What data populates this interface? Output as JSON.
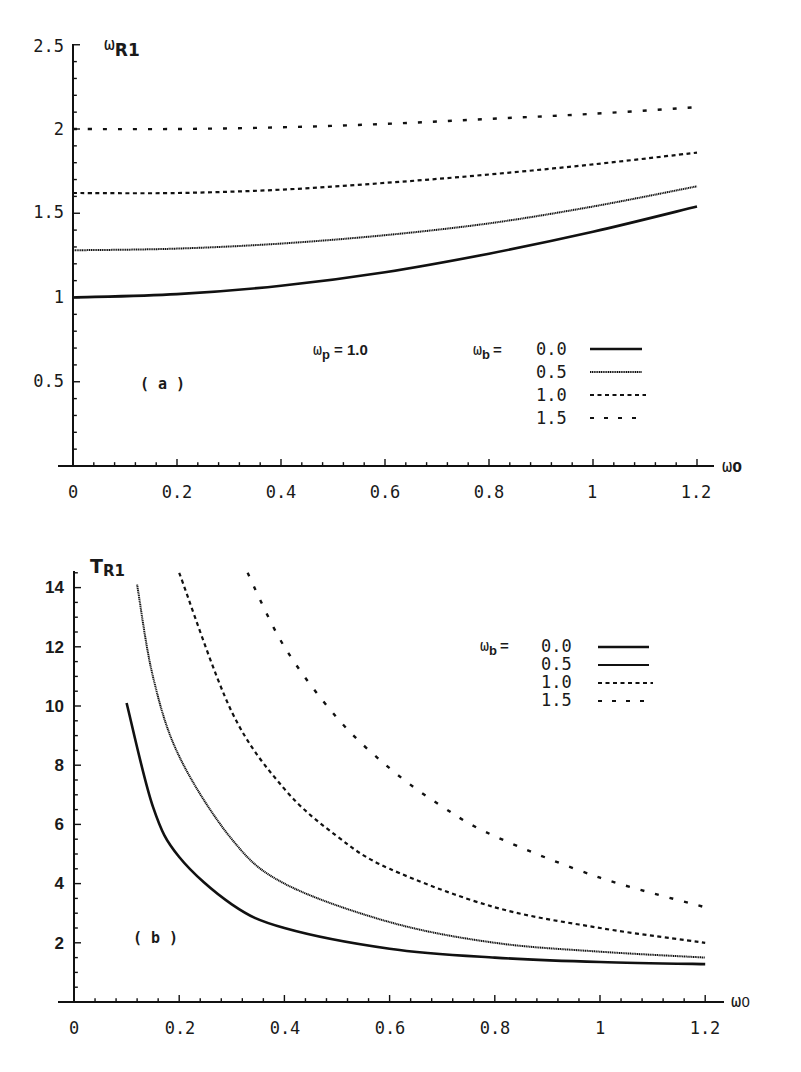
{
  "chart_data": [
    {
      "panel": "(a)",
      "type": "line",
      "title": "",
      "xlabel": "ω0",
      "ylabel": "ωR1",
      "xlim": [
        0,
        1.2
      ],
      "ylim": [
        0,
        2.5
      ],
      "x_ticks": [
        "0",
        "0.2",
        "0.4",
        "0.6",
        "0.8",
        "1",
        "1.2"
      ],
      "y_ticks": [
        "0.5",
        "1",
        "1.5",
        "2",
        "2.5"
      ],
      "grid": false,
      "annotation": "ωp = 1.0",
      "legend_title": "ωb =",
      "legend_position": "inside-right-middle",
      "x": [
        0,
        0.2,
        0.4,
        0.6,
        0.8,
        1.0,
        1.2
      ],
      "series": [
        {
          "name": "0.0",
          "style": "solid-thick",
          "values": [
            1.0,
            1.02,
            1.07,
            1.15,
            1.26,
            1.39,
            1.54
          ]
        },
        {
          "name": "0.5",
          "style": "solid-thin",
          "values": [
            1.28,
            1.29,
            1.32,
            1.37,
            1.44,
            1.54,
            1.66
          ]
        },
        {
          "name": "1.0",
          "style": "fine-dash",
          "values": [
            1.62,
            1.62,
            1.64,
            1.68,
            1.73,
            1.79,
            1.86
          ]
        },
        {
          "name": "1.5",
          "style": "coarse-dash",
          "values": [
            2.0,
            2.0,
            2.01,
            2.03,
            2.06,
            2.09,
            2.13
          ]
        }
      ]
    },
    {
      "panel": "(b)",
      "type": "line",
      "title": "",
      "xlabel": "ω0",
      "ylabel": "TR1",
      "xlim": [
        0,
        1.2
      ],
      "ylim": [
        0,
        14.5
      ],
      "x_ticks": [
        "0",
        "0.2",
        "0.4",
        "0.6",
        "0.8",
        "1",
        "1.2"
      ],
      "y_ticks": [
        "2",
        "4",
        "6",
        "8",
        "10",
        "12",
        "14"
      ],
      "grid": false,
      "legend_title": "ωb =",
      "legend_position": "inside-upper-right",
      "series": [
        {
          "name": "0.0",
          "style": "solid-thick",
          "x": [
            0.1,
            0.15,
            0.2,
            0.3,
            0.4,
            0.6,
            0.8,
            1.0,
            1.2
          ],
          "values": [
            10.1,
            6.6,
            4.9,
            3.3,
            2.5,
            1.8,
            1.5,
            1.35,
            1.28
          ]
        },
        {
          "name": "0.5",
          "style": "solid-thin",
          "x": [
            0.12,
            0.15,
            0.2,
            0.3,
            0.4,
            0.6,
            0.8,
            1.0,
            1.2
          ],
          "values": [
            14.1,
            11.0,
            8.3,
            5.5,
            4.0,
            2.7,
            2.0,
            1.7,
            1.5
          ]
        },
        {
          "name": "1.0",
          "style": "fine-dash",
          "x": [
            0.2,
            0.3,
            0.4,
            0.5,
            0.6,
            0.8,
            1.0,
            1.2
          ],
          "values": [
            14.5,
            9.8,
            7.2,
            5.6,
            4.5,
            3.2,
            2.5,
            2.0
          ]
        },
        {
          "name": "1.5",
          "style": "coarse-dash",
          "x": [
            0.33,
            0.4,
            0.5,
            0.6,
            0.7,
            0.8,
            1.0,
            1.2
          ],
          "values": [
            14.5,
            12.0,
            9.6,
            7.9,
            6.6,
            5.6,
            4.2,
            3.2
          ]
        }
      ]
    }
  ],
  "panel_a": {
    "y_label_main": "ω",
    "y_label_sub": "R1",
    "x_label_main": "ω",
    "x_label_sub": "0",
    "panel_tag": "( a )",
    "param_main": "ω",
    "param_sub": "p",
    "param_value": "= 1.0",
    "legend_main": "ω",
    "legend_sub": "b",
    "legend_eq": "=",
    "legend_items": [
      "0.0",
      "0.5",
      "1.0",
      "1.5"
    ],
    "x_tick_labels": [
      "0",
      "0.2",
      "0.4",
      "0.6",
      "0.8",
      "1",
      "1.2"
    ],
    "y_tick_labels": [
      "0.5",
      "1",
      "1.5",
      "2",
      "2.5"
    ]
  },
  "panel_b": {
    "y_label_main": "T",
    "y_label_sub": "R1",
    "x_label_main": "ω",
    "x_label_sub": "0",
    "panel_tag": "( b )",
    "legend_main": "ω",
    "legend_sub": "b",
    "legend_eq": "=",
    "legend_items": [
      "0.0",
      "0.5",
      "1.0",
      "1.5"
    ],
    "x_tick_labels": [
      "0",
      "0.2",
      "0.4",
      "0.6",
      "0.8",
      "1",
      "1.2"
    ],
    "y_tick_labels": [
      "2",
      "4",
      "6",
      "8",
      "10",
      "12",
      "14"
    ]
  }
}
